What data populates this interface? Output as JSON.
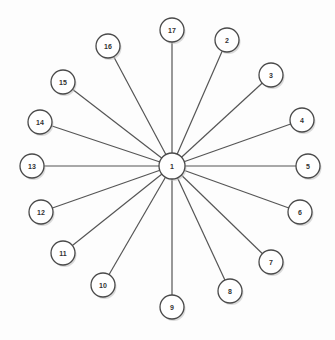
{
  "diagram": {
    "type": "star-graph",
    "hub": {
      "id": "1",
      "label": "1"
    },
    "spokes": [
      {
        "id": "2",
        "label": "2"
      },
      {
        "id": "3",
        "label": "3"
      },
      {
        "id": "4",
        "label": "4"
      },
      {
        "id": "5",
        "label": "5"
      },
      {
        "id": "6",
        "label": "6"
      },
      {
        "id": "7",
        "label": "7"
      },
      {
        "id": "8",
        "label": "8"
      },
      {
        "id": "9",
        "label": "9"
      },
      {
        "id": "10",
        "label": "10"
      },
      {
        "id": "11",
        "label": "11"
      },
      {
        "id": "12",
        "label": "12"
      },
      {
        "id": "13",
        "label": "13"
      },
      {
        "id": "14",
        "label": "14"
      },
      {
        "id": "15",
        "label": "15"
      },
      {
        "id": "16",
        "label": "16"
      },
      {
        "id": "17",
        "label": "17"
      }
    ],
    "edges": [
      [
        "1",
        "2"
      ],
      [
        "1",
        "3"
      ],
      [
        "1",
        "4"
      ],
      [
        "1",
        "5"
      ],
      [
        "1",
        "6"
      ],
      [
        "1",
        "7"
      ],
      [
        "1",
        "8"
      ],
      [
        "1",
        "9"
      ],
      [
        "1",
        "10"
      ],
      [
        "1",
        "11"
      ],
      [
        "1",
        "12"
      ],
      [
        "1",
        "13"
      ],
      [
        "1",
        "14"
      ],
      [
        "1",
        "15"
      ],
      [
        "1",
        "16"
      ],
      [
        "1",
        "17"
      ]
    ]
  }
}
